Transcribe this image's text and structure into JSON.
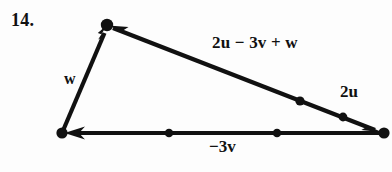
{
  "figure": {
    "exercise_number": "14.",
    "type": "vector-triangle-diagram",
    "background_color": "#fdfdfd",
    "stroke_color": "#111111",
    "vertices": {
      "origin": {
        "name": "bottom-left-vertex",
        "x": 62,
        "y": 133
      },
      "apex": {
        "name": "top-vertex",
        "x": 107,
        "y": 25
      },
      "terminal": {
        "name": "bottom-right-vertex",
        "x": 384,
        "y": 133
      }
    },
    "vectors": [
      {
        "id": "w",
        "label": "w",
        "from": "bottom-left-vertex",
        "to": "top-vertex",
        "arrowheads": "to",
        "midpoint_dots": 0
      },
      {
        "id": "neg3v",
        "label": "−3v",
        "from": "bottom-right-vertex",
        "to": "bottom-left-vertex",
        "arrowheads": "to",
        "midpoint_dots": 2
      },
      {
        "id": "sum",
        "label": "2u − 3v + w",
        "from": "bottom-right-vertex",
        "to": "top-vertex",
        "arrowheads": "both",
        "midpoint_dots": 2
      }
    ],
    "extra_labels": [
      {
        "id": "2u",
        "label": "2u"
      }
    ],
    "labels": {
      "w": "w",
      "sum": "2u − 3v + w",
      "two_u": "2u",
      "neg_three_v": "−3v"
    }
  }
}
